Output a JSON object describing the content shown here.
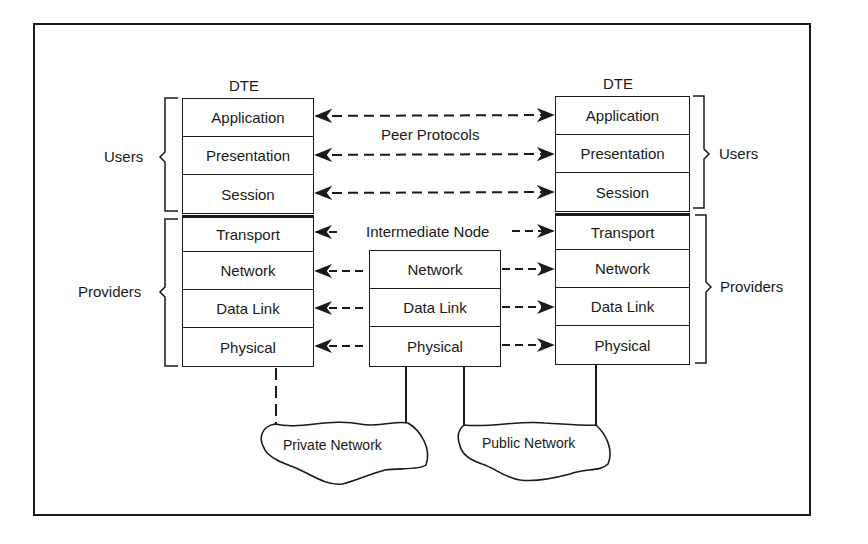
{
  "diagram": {
    "left_dte": {
      "label": "DTE",
      "layers": [
        "Application",
        "Presentation",
        "Session",
        "Transport",
        "Network",
        "Data Link",
        "Physical"
      ],
      "groups": {
        "users": "Users",
        "providers": "Providers"
      }
    },
    "right_dte": {
      "label": "DTE",
      "layers": [
        "Application",
        "Presentation",
        "Session",
        "Transport",
        "Network",
        "Data Link",
        "Physical"
      ],
      "groups": {
        "users": "Users",
        "providers": "Providers"
      }
    },
    "intermediate_node": {
      "label": "Intermediate Node",
      "layers": [
        "Network",
        "Data Link",
        "Physical"
      ]
    },
    "peer_protocols_label": "Peer Protocols",
    "networks": {
      "private": "Private Network",
      "public": "Public Network"
    },
    "colors": {
      "line": "#1a1a1a",
      "background": "#ffffff"
    }
  }
}
